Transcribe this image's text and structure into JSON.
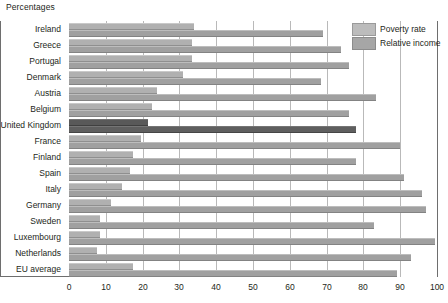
{
  "unit_label": "Percentages",
  "legend": {
    "items": [
      {
        "label": "Poverty rate",
        "color": "#bcbcbc",
        "icon": "legend-swatch-icon"
      },
      {
        "label": "Relative income",
        "color": "#a6a6a6",
        "icon": "legend-swatch-icon"
      }
    ]
  },
  "highlight": {
    "category": "United Kingdom",
    "color": "#595959"
  },
  "chart_data": {
    "type": "bar",
    "orientation": "horizontal",
    "title": "",
    "subtitle": "",
    "xlabel": "Percentages",
    "ylabel": "",
    "xlim": [
      0,
      100
    ],
    "xticks": [
      0,
      10,
      20,
      30,
      40,
      50,
      60,
      70,
      80,
      90,
      100
    ],
    "xtick_labels": [
      "0",
      "10",
      "20",
      "30",
      "40",
      "50",
      "60",
      "70",
      "80",
      "90",
      "100"
    ],
    "grid": "vertical",
    "legend_position": "top-right",
    "categories": [
      "Ireland",
      "Greece",
      "Portugal",
      "Denmark",
      "Austria",
      "Belgium",
      "United Kingdom",
      "France",
      "Finland",
      "Spain",
      "Italy",
      "Germany",
      "Sweden",
      "Luxembourg",
      "Netherlands",
      "EU average"
    ],
    "series": [
      {
        "name": "Poverty rate",
        "color": "#b0b0b0",
        "values": [
          34,
          33.5,
          33.5,
          31,
          24,
          22.5,
          21.5,
          19.5,
          17.5,
          16.5,
          14.5,
          11.5,
          8.5,
          8.5,
          7.5,
          17.5
        ]
      },
      {
        "name": "Relative income",
        "color": "#a0a0a0",
        "values": [
          69,
          74,
          76,
          68.5,
          83.5,
          76,
          78,
          90,
          78,
          91,
          96,
          97,
          83,
          99.5,
          93,
          89
        ]
      }
    ]
  }
}
